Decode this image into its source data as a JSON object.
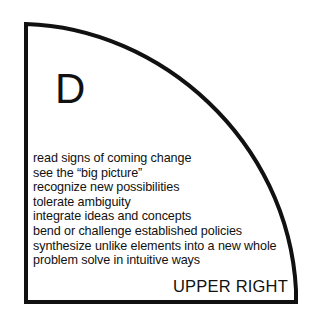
{
  "diagram": {
    "letter": "D",
    "position_label": "UPPER RIGHT",
    "traits": [
      "read signs of coming change",
      "see the “big picture”",
      "recognize new possibilities",
      "tolerate ambiguity",
      "integrate ideas and concepts",
      "bend or challenge established policies",
      "synthesize unlike elements into a new whole",
      "problem solve in intuitive ways"
    ],
    "stroke_color": "#111111",
    "background_color": "#ffffff"
  }
}
